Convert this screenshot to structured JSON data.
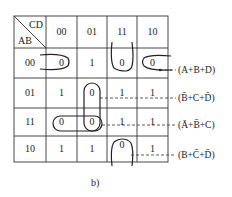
{
  "kmap": {
    "row_var": "AB",
    "col_var": "CD",
    "col_headers": [
      "00",
      "01",
      "11",
      "10"
    ],
    "row_headers": [
      "00",
      "01",
      "11",
      "10"
    ],
    "cells": [
      [
        "0",
        "1",
        "0",
        "0"
      ],
      [
        "1",
        "0",
        "1",
        "1"
      ],
      [
        "0",
        "0",
        "1",
        "1"
      ],
      [
        "1",
        "1",
        "0",
        "1"
      ]
    ]
  },
  "groups": [
    {
      "label": "(A+B+D)",
      "cells": [
        "00-00",
        "00-10"
      ]
    },
    {
      "label": "(B̄+C+D̄)",
      "cells": [
        "01-01",
        "11-01"
      ]
    },
    {
      "label": "(Ā+B̄+C)",
      "cells": [
        "11-00",
        "11-01"
      ]
    },
    {
      "label": "(B+C̄+D̄)",
      "cells": [
        "00-11",
        "10-11"
      ]
    }
  ],
  "caption": "b)"
}
